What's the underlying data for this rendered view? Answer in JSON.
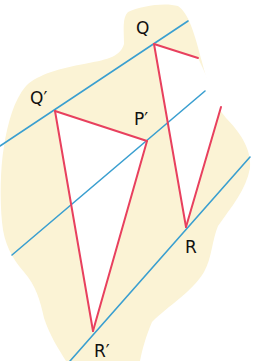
{
  "diagram": {
    "colors": {
      "background": "#ffffff",
      "region": "#fbf3d5",
      "parallel_lines": "#3a9fd0",
      "segments": "#e8405e",
      "triangle_fill": "#ffffff",
      "label": "#111111"
    },
    "labels": {
      "Q": "Q",
      "Q_prime": "Q′",
      "P_prime": "P′",
      "R": "R",
      "R_prime": "R′"
    },
    "points": {
      "Q": [
        154,
        44
      ],
      "Q_prime": [
        55,
        111
      ],
      "P_prime": [
        147,
        141
      ],
      "R": [
        186,
        227
      ],
      "R_prime": [
        93,
        331
      ]
    },
    "parallel_lines": [
      {
        "name": "line-through-Q-Qprime",
        "x1": 0,
        "y1": 146,
        "x2": 188,
        "y2": 21
      },
      {
        "name": "line-through-Pprime",
        "x1": 12,
        "y1": 255,
        "x2": 205,
        "y2": 91
      },
      {
        "name": "line-through-R-Rprime",
        "x1": 70,
        "y1": 361,
        "x2": 250,
        "y2": 157
      }
    ],
    "segments": [
      {
        "name": "segment-Q-to-P",
        "x1": 154,
        "y1": 44,
        "x2": 198,
        "y2": 58
      },
      {
        "name": "segment-Q-R",
        "x1": 154,
        "y1": 44,
        "x2": 186,
        "y2": 227
      },
      {
        "name": "segment-R-to-P",
        "x1": 186,
        "y1": 227,
        "x2": 221,
        "y2": 107
      },
      {
        "name": "segment-Qprime-Pprime",
        "x1": 55,
        "y1": 111,
        "x2": 147,
        "y2": 141
      },
      {
        "name": "segment-Qprime-Rprime",
        "x1": 55,
        "y1": 111,
        "x2": 93,
        "y2": 331
      },
      {
        "name": "segment-Pprime-Rprime",
        "x1": 147,
        "y1": 141,
        "x2": 93,
        "y2": 331
      }
    ]
  }
}
